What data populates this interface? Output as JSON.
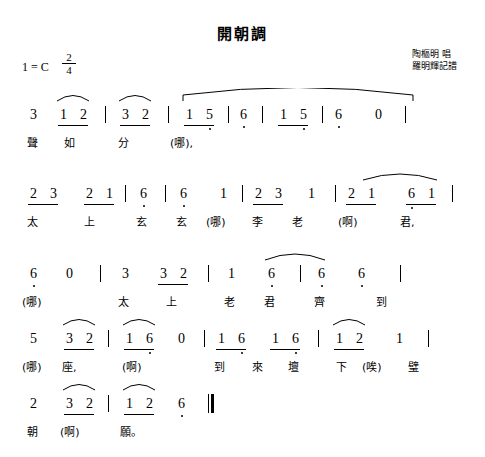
{
  "document": {
    "title": "開朝調",
    "key_signature": "1 = C",
    "meter_numerator": "2",
    "meter_denominator": "4",
    "credits": [
      "陶樞明 唱",
      "羅明輝記譜"
    ]
  },
  "score": {
    "system_1": {
      "notes": [
        {
          "text": "3",
          "x": 30,
          "y": 12
        },
        {
          "text": "1",
          "x": 60,
          "y": 12
        },
        {
          "text": "2",
          "x": 80,
          "y": 12
        },
        {
          "text": "3",
          "x": 122,
          "y": 12
        },
        {
          "text": "2",
          "x": 142,
          "y": 12
        },
        {
          "text": "1",
          "x": 186,
          "y": 12
        },
        {
          "text": "5",
          "x": 206,
          "y": 12
        },
        {
          "text": "6",
          "x": 240,
          "y": 12
        },
        {
          "text": "1",
          "x": 280,
          "y": 12
        },
        {
          "text": "5",
          "x": 300,
          "y": 12
        },
        {
          "text": "6",
          "x": 335,
          "y": 12
        },
        {
          "text": "0",
          "x": 375,
          "y": 12
        }
      ],
      "lyrics": [
        {
          "text": "聲",
          "x": 27,
          "y": 38
        },
        {
          "text": "如",
          "x": 64,
          "y": 38
        },
        {
          "text": "分",
          "x": 118,
          "y": 38
        },
        {
          "text": "(哪),",
          "x": 170,
          "y": 38
        }
      ]
    },
    "system_2": {
      "notes": [
        {
          "text": "2",
          "x": 30,
          "y": 12
        },
        {
          "text": "3",
          "x": 50,
          "y": 12
        },
        {
          "text": "2",
          "x": 86,
          "y": 12
        },
        {
          "text": "1",
          "x": 106,
          "y": 12
        },
        {
          "text": "6",
          "x": 140,
          "y": 12
        },
        {
          "text": "6",
          "x": 180,
          "y": 12
        },
        {
          "text": "1",
          "x": 220,
          "y": 12
        },
        {
          "text": "2",
          "x": 255,
          "y": 12
        },
        {
          "text": "3",
          "x": 275,
          "y": 12
        },
        {
          "text": "1",
          "x": 308,
          "y": 12
        },
        {
          "text": "2",
          "x": 348,
          "y": 12
        },
        {
          "text": "1",
          "x": 368,
          "y": 12
        },
        {
          "text": "6",
          "x": 408,
          "y": 12
        },
        {
          "text": "1",
          "x": 428,
          "y": 12
        }
      ],
      "lyrics": [
        {
          "text": "太",
          "x": 27,
          "y": 38
        },
        {
          "text": "上",
          "x": 84,
          "y": 38
        },
        {
          "text": "玄",
          "x": 136,
          "y": 38
        },
        {
          "text": "玄",
          "x": 176,
          "y": 38
        },
        {
          "text": "(哪)",
          "x": 208,
          "y": 38
        },
        {
          "text": "李",
          "x": 252,
          "y": 38
        },
        {
          "text": "老",
          "x": 292,
          "y": 38
        },
        {
          "text": "(啊)",
          "x": 340,
          "y": 38
        },
        {
          "text": "君,",
          "x": 400,
          "y": 38
        }
      ]
    },
    "system_3": {
      "notes": [
        {
          "text": "6",
          "x": 30,
          "y": 12
        },
        {
          "text": "0",
          "x": 66,
          "y": 12
        },
        {
          "text": "3",
          "x": 122,
          "y": 12
        },
        {
          "text": "3",
          "x": 160,
          "y": 12
        },
        {
          "text": "2",
          "x": 180,
          "y": 12
        },
        {
          "text": "1",
          "x": 228,
          "y": 12
        },
        {
          "text": "6",
          "x": 268,
          "y": 12
        },
        {
          "text": "6",
          "x": 318,
          "y": 12
        },
        {
          "text": "6",
          "x": 358,
          "y": 12
        }
      ],
      "lyrics": [
        {
          "text": "(哪)",
          "x": 22,
          "y": 38
        },
        {
          "text": "太",
          "x": 118,
          "y": 38
        },
        {
          "text": "上",
          "x": 166,
          "y": 38
        },
        {
          "text": "老",
          "x": 224,
          "y": 38
        },
        {
          "text": "君",
          "x": 264,
          "y": 38
        },
        {
          "text": "齊",
          "x": 314,
          "y": 38
        },
        {
          "text": "到",
          "x": 376,
          "y": 38
        }
      ]
    },
    "system_4": {
      "notes": [
        {
          "text": "5",
          "x": 30,
          "y": 12
        },
        {
          "text": "3",
          "x": 66,
          "y": 12
        },
        {
          "text": "2",
          "x": 86,
          "y": 12
        },
        {
          "text": "1",
          "x": 126,
          "y": 12
        },
        {
          "text": "6",
          "x": 146,
          "y": 12
        },
        {
          "text": "0",
          "x": 178,
          "y": 12
        },
        {
          "text": "1",
          "x": 218,
          "y": 12
        },
        {
          "text": "6",
          "x": 238,
          "y": 12
        },
        {
          "text": "1",
          "x": 272,
          "y": 12
        },
        {
          "text": "6",
          "x": 292,
          "y": 12
        },
        {
          "text": "1",
          "x": 336,
          "y": 12
        },
        {
          "text": "2",
          "x": 356,
          "y": 12
        },
        {
          "text": "1",
          "x": 396,
          "y": 12
        }
      ],
      "lyrics": [
        {
          "text": "(哪)",
          "x": 22,
          "y": 38
        },
        {
          "text": "座,",
          "x": 62,
          "y": 38
        },
        {
          "text": "(啊)",
          "x": 122,
          "y": 38
        },
        {
          "text": "到",
          "x": 214,
          "y": 38
        },
        {
          "text": "來",
          "x": 252,
          "y": 38
        },
        {
          "text": "壇",
          "x": 288,
          "y": 38
        },
        {
          "text": "下",
          "x": 336,
          "y": 38
        },
        {
          "text": "(唉)",
          "x": 362,
          "y": 38
        },
        {
          "text": "璧",
          "x": 408,
          "y": 38
        }
      ]
    },
    "system_5": {
      "notes": [
        {
          "text": "2",
          "x": 30,
          "y": 12
        },
        {
          "text": "3",
          "x": 66,
          "y": 12
        },
        {
          "text": "2",
          "x": 86,
          "y": 12
        },
        {
          "text": "1",
          "x": 126,
          "y": 12
        },
        {
          "text": "2",
          "x": 146,
          "y": 12
        },
        {
          "text": "6",
          "x": 178,
          "y": 12
        }
      ],
      "lyrics": [
        {
          "text": "朝",
          "x": 27,
          "y": 38
        },
        {
          "text": "(啊)",
          "x": 60,
          "y": 38
        },
        {
          "text": "願。",
          "x": 120,
          "y": 38
        }
      ]
    }
  }
}
